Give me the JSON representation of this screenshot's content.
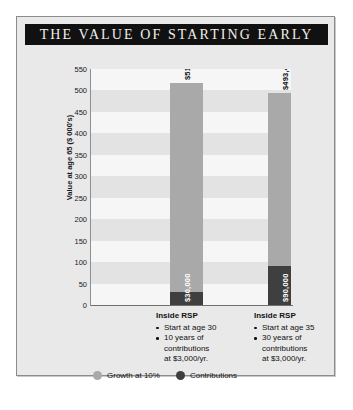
{
  "title": "THE VALUE OF STARTING EARLY",
  "colors": {
    "banner_bg": "#111111",
    "banner_text": "#f2efe9",
    "card_bg": "#e9e9e9",
    "plot_bg": "#f6f6f6",
    "band": "#e3e3e3",
    "growth": "#a9a9a9",
    "contributions": "#3f3f3f"
  },
  "chart_data": {
    "type": "bar",
    "title": "THE VALUE OF STARTING EARLY",
    "xlabel": "",
    "ylabel": "Value at age 65 ($ 000's)",
    "ylim": [
      0,
      550
    ],
    "yticks": [
      0,
      50,
      100,
      150,
      200,
      250,
      300,
      350,
      400,
      450,
      500,
      550
    ],
    "ytick_labels": [
      "0",
      "50",
      "100",
      "150",
      "200",
      "250",
      "300",
      "350",
      "400",
      "450",
      "500",
      "550"
    ],
    "grid": "horizontal-bands",
    "legend_position": "bottom-left",
    "stacked": true,
    "categories": [
      "Inside RSP — Start at age 30",
      "Inside RSP — Start at age 35"
    ],
    "series": [
      {
        "name": "Contributions",
        "color": "#3f3f3f",
        "values": [
          30,
          90
        ],
        "value_labels": [
          "$30,000",
          "$90,000"
        ]
      },
      {
        "name": "Growth at 10%",
        "color": "#a9a9a9",
        "values": [
          488.03,
          403.48
        ],
        "value_labels": [
          "",
          ""
        ]
      }
    ],
    "totals": [
      518.03,
      493.48
    ],
    "total_labels": [
      "$518,030",
      "$493,480"
    ]
  },
  "bars": [
    {
      "total_label": "$518,030",
      "total_value": 518.03,
      "contrib_label": "$30,000",
      "contrib_value": 30
    },
    {
      "total_label": "$493,480",
      "total_value": 493.48,
      "contrib_label": "$90,000",
      "contrib_value": 90
    }
  ],
  "categories": [
    {
      "title": "Inside RSP",
      "bullets": [
        "Start at age 30",
        "10 years of"
      ],
      "cont_line": "contributions",
      "rate_line": "at $3,000/yr."
    },
    {
      "title": "Inside RSP",
      "bullets": [
        "Start at age 35",
        "30 years of"
      ],
      "cont_line": "contributions",
      "rate_line": "at $3,000/yr."
    }
  ],
  "legend": [
    {
      "label": "Growth at 10%",
      "color": "#a9a9a9"
    },
    {
      "label": "Contributions",
      "color": "#3f3f3f"
    }
  ]
}
